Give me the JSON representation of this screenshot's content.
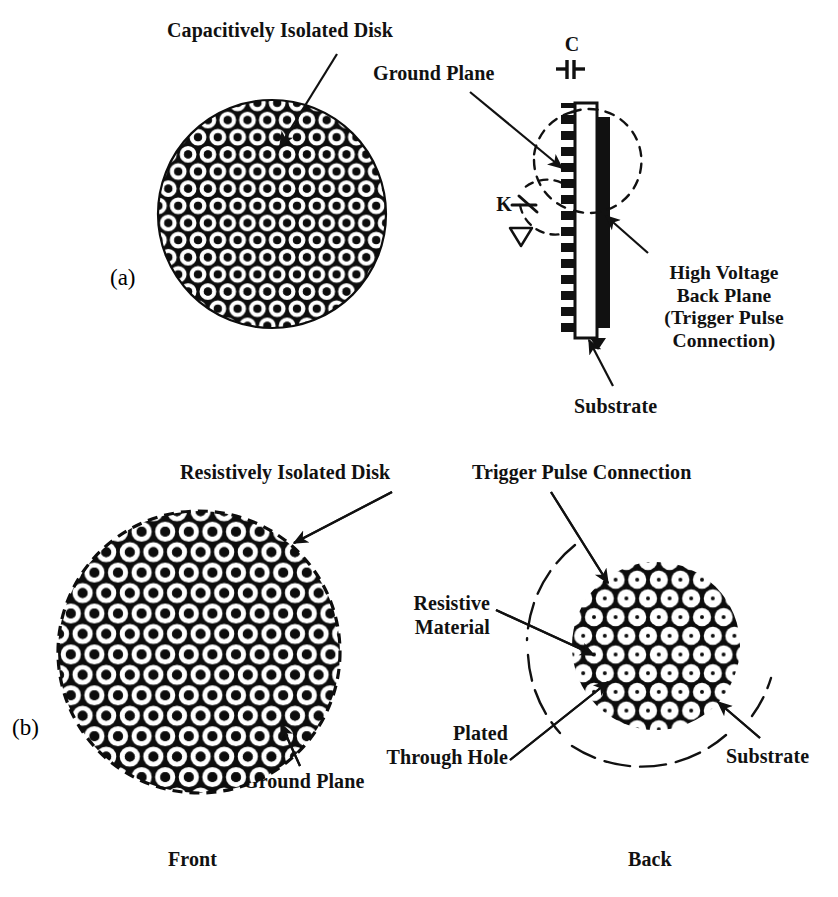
{
  "figure": {
    "type": "technical-diagram",
    "panels": [
      {
        "tag": "(a)",
        "name": "capacitively-isolated",
        "views": [
          "front-disk",
          "cross-section"
        ]
      },
      {
        "tag": "(b)",
        "name": "resistively-isolated",
        "views": [
          "front-disk",
          "back-disk"
        ]
      }
    ]
  },
  "panel_a": {
    "tag": "(a)",
    "labels": {
      "capacitively_isolated_disk": "Capacitively Isolated Disk",
      "ground_plane": "Ground Plane",
      "high_voltage_back_plane": "High Voltage\nBack Plane\n(Trigger Pulse\nConnection)",
      "substrate": "Substrate",
      "capacitor_symbol": "C",
      "switch_symbol": "K"
    }
  },
  "panel_b": {
    "tag": "(b)",
    "labels": {
      "resistively_isolated_disk": "Resistively Isolated Disk",
      "ground_plane": "Ground Plane",
      "trigger_pulse_connection": "Trigger Pulse Connection",
      "resistive_material": "Resistive\nMaterial",
      "plated_through_hole": "Plated\nThrough Hole",
      "substrate": "Substrate"
    }
  },
  "view_captions": {
    "front": "Front",
    "back": "Back"
  },
  "colors": {
    "ink": "#111111",
    "background": "#ffffff",
    "pattern_fill": "#0d0d0d",
    "pattern_ring": "#ffffff"
  }
}
